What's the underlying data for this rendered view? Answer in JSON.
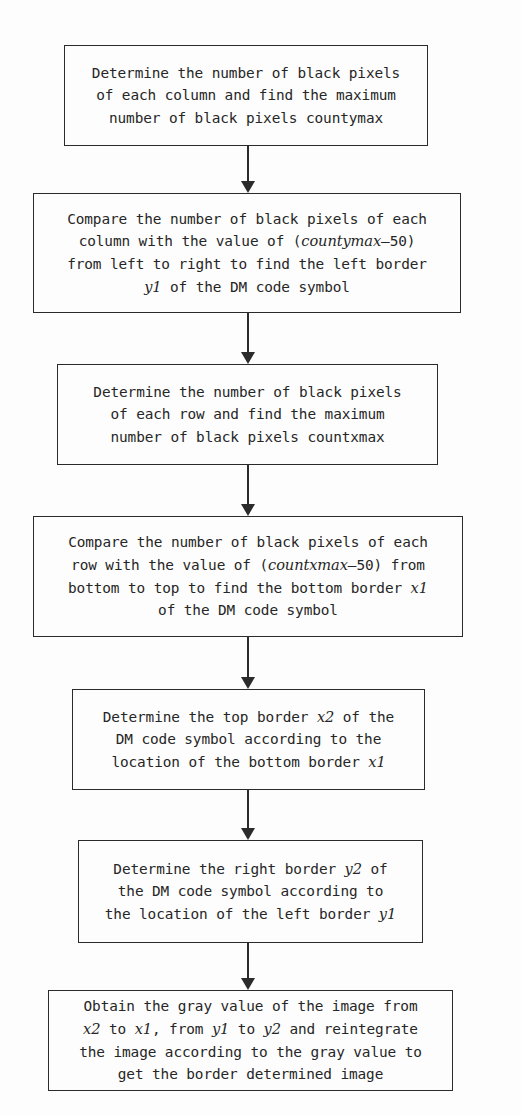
{
  "diagram": {
    "background_color": "#fdfdfd",
    "line_color": "#2b2b2b",
    "text_color": "#262626",
    "nodes": [
      {
        "id": "node-1",
        "name": "determine-column-black-pixels",
        "text": "Determine the number of black pixels\nof each column and find the maximum\nnumber of black pixels countymax",
        "x": 64,
        "y": 45,
        "width": 364,
        "height": 101
      },
      {
        "id": "node-2",
        "name": "find-left-border-y1",
        "text_html": "Compare the number of black pixels of each\ncolumn with the value of (<i>countymax</i>&#8211;50)\nfrom left to right to find the left border\n<i>y1</i> of the DM code symbol",
        "x": 33,
        "y": 193,
        "width": 428,
        "height": 120
      },
      {
        "id": "node-3",
        "name": "determine-row-black-pixels",
        "text": "Determine the number of black pixels\nof each row and find the maximum\nnumber of black pixels countxmax",
        "x": 57,
        "y": 364,
        "width": 381,
        "height": 101
      },
      {
        "id": "node-4",
        "name": "find-bottom-border-x1",
        "text_html": "Compare the number of black pixels of each\nrow with the value of (<i>countxmax</i>&#8211;50) from\nbottom to top to find the bottom border <i>x1</i>\nof the DM code symbol",
        "x": 33,
        "y": 516,
        "width": 430,
        "height": 121
      },
      {
        "id": "node-5",
        "name": "determine-top-border-x2",
        "text_html": "Determine the top border <i>x2</i> of the\nDM code symbol according to the\nlocation of the bottom border <i>x1</i>",
        "x": 72,
        "y": 689,
        "width": 353,
        "height": 101
      },
      {
        "id": "node-6",
        "name": "determine-right-border-y2",
        "text_html": "Determine the right border <i>y2</i> of\nthe DM code symbol according to\nthe location of the left border <i>y1</i>",
        "x": 78,
        "y": 840,
        "width": 345,
        "height": 103
      },
      {
        "id": "node-7",
        "name": "obtain-gray-value-reintegrate-image",
        "text_html": "Obtain the gray value of the image from\n<i>x2</i> to <i>x1</i>, from <i>y1</i> to <i>y2</i> and reintegrate\nthe image according to the gray value to\nget the border determined image",
        "x": 48,
        "y": 990,
        "width": 405,
        "height": 101
      }
    ],
    "connectors": [
      {
        "name": "connector-1-to-2",
        "x": 247,
        "y": 146,
        "length": 47
      },
      {
        "name": "connector-2-to-3",
        "x": 247,
        "y": 313,
        "length": 51
      },
      {
        "name": "connector-3-to-4",
        "x": 247,
        "y": 465,
        "length": 51
      },
      {
        "name": "connector-4-to-5",
        "x": 247,
        "y": 637,
        "length": 52
      },
      {
        "name": "connector-5-to-6",
        "x": 247,
        "y": 790,
        "length": 50
      },
      {
        "name": "connector-6-to-7",
        "x": 247,
        "y": 943,
        "length": 47
      }
    ]
  }
}
